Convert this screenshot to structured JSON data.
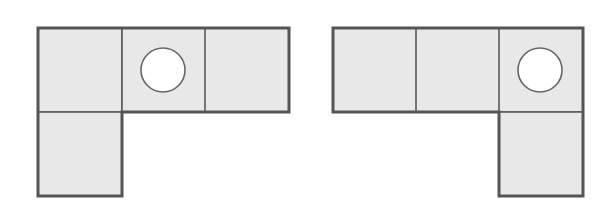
{
  "diagram": {
    "colors": {
      "tile_fill": "#e8e8e8",
      "tile_stroke": "#5a5a5a",
      "outline_stroke": "#555555",
      "hole_fill": "#ffffff",
      "background": "#ffffff"
    },
    "tile_size": 84,
    "shapes": [
      {
        "id": "left-l-shape",
        "orientation": "top row of 3, extra tile below left end",
        "tiles": [
          {
            "x": 38,
            "y": 28,
            "hole": false
          },
          {
            "x": 122,
            "y": 28,
            "hole": true
          },
          {
            "x": 205,
            "y": 28,
            "hole": false
          },
          {
            "x": 38,
            "y": 112,
            "hole": false
          }
        ],
        "hole": {
          "cx": 163,
          "cy": 70,
          "r": 22
        }
      },
      {
        "id": "right-l-shape",
        "orientation": "top row of 3, extra tile below right end",
        "tiles": [
          {
            "x": 333,
            "y": 28,
            "hole": false
          },
          {
            "x": 416,
            "y": 28,
            "hole": false
          },
          {
            "x": 499,
            "y": 28,
            "hole": true
          },
          {
            "x": 499,
            "y": 112,
            "hole": false
          }
        ],
        "hole": {
          "cx": 540,
          "cy": 70,
          "r": 22
        }
      }
    ]
  }
}
